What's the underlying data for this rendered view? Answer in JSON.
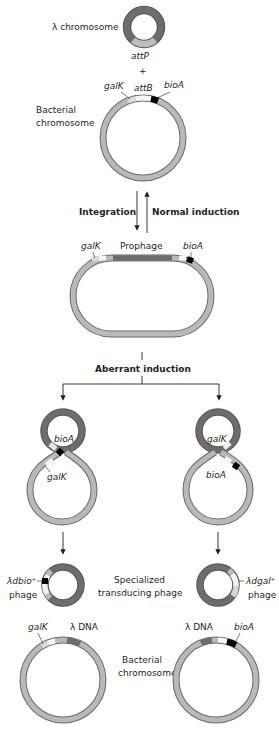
{
  "colors": {
    "lambda_dna": "#6d6d6d",
    "bacterial_dna": "#b9b9b9",
    "outline": "#6a6a6a",
    "bioA_marker": "#000000",
    "galK_marker": "#d9d9d9",
    "att_site": "#f4f4f4",
    "text": "#231f20"
  },
  "top": {
    "lambda_label": "λ chromosome",
    "attP": "attP",
    "plus": "+",
    "galK": "galK",
    "attB": "attB",
    "bioA": "bioA",
    "bacterial_label_1": "Bacterial",
    "bacterial_label_2": "chromosome"
  },
  "arrows": {
    "integration": "Integration",
    "normal_induction": "Normal induction"
  },
  "prophage": {
    "galK": "galK",
    "prophage": "Prophage",
    "bioA": "bioA"
  },
  "aberrant": {
    "label": "Aberrant induction",
    "left": {
      "top_gene": "bioA",
      "bottom_gene": "galK"
    },
    "right": {
      "top_gene": "galK",
      "bottom_gene": "bioA"
    }
  },
  "phages": {
    "left_label_1": "λdbio",
    "left_sup": "+",
    "left_label_2": "phage",
    "center_1": "Specialized",
    "center_2": "transducing phage",
    "right_label_1": "λdgal",
    "right_sup": "+",
    "right_label_2": "phage"
  },
  "bottom": {
    "left": {
      "galK": "galK",
      "lambda_dna": "λ DNA"
    },
    "right": {
      "lambda_dna": "λ DNA",
      "bioA": "bioA"
    },
    "center_1": "Bacterial",
    "center_2": "chromosome"
  }
}
